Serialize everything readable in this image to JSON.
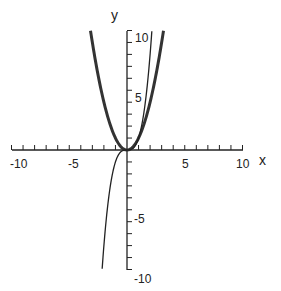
{
  "chart_data": {
    "type": "line",
    "title": "",
    "xlabel": "x",
    "ylabel": "y",
    "xlim": [
      -10,
      10
    ],
    "ylim": [
      -10,
      10
    ],
    "grid": false,
    "x_tick_labels": [
      "-10",
      "-5",
      "5",
      "10"
    ],
    "y_tick_labels": [
      "10",
      "5",
      "-5",
      "-10"
    ],
    "x_minor_ticks_step": 1,
    "y_minor_ticks_step": 1,
    "series": [
      {
        "name": "y = x^2",
        "style": "thick",
        "x": [
          -3.16,
          -3,
          -2,
          -1,
          0,
          1,
          2,
          3,
          3.16
        ],
        "y": [
          10,
          9,
          4,
          1,
          0,
          1,
          4,
          9,
          10
        ]
      },
      {
        "name": "y = x^3",
        "style": "thin",
        "x": [
          -2.15,
          -2,
          -1,
          0,
          1,
          2,
          2.15
        ],
        "y": [
          -10,
          -8,
          -1,
          0,
          1,
          8,
          10
        ]
      }
    ]
  },
  "labels": {
    "x_axis": "x",
    "y_axis": "y",
    "xt_m10": "-10",
    "xt_m5": "-5",
    "xt_5": "5",
    "xt_10": "10",
    "yt_10": "10",
    "yt_5": "5",
    "yt_m5": "-5",
    "yt_m10": "-10"
  }
}
